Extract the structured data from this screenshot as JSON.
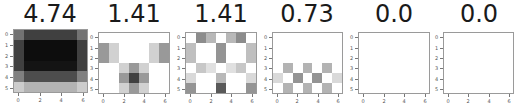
{
  "chart_data": [
    {
      "type": "heatmap",
      "title": "4.74",
      "rows": 6,
      "cols": 7,
      "xticks": [
        "0",
        "2",
        "4",
        "6"
      ],
      "yticks": [
        "0",
        "1",
        "2",
        "3",
        "4",
        "5"
      ],
      "colormap": "gray_r",
      "values": [
        [
          0.55,
          0.75,
          0.75,
          0.75,
          0.75,
          0.75,
          0.55
        ],
        [
          0.75,
          0.95,
          0.95,
          0.95,
          0.95,
          0.95,
          0.75
        ],
        [
          0.75,
          0.95,
          0.95,
          0.95,
          0.95,
          0.95,
          0.75
        ],
        [
          0.75,
          0.92,
          0.92,
          0.92,
          0.92,
          0.92,
          0.75
        ],
        [
          0.5,
          0.7,
          0.7,
          0.7,
          0.7,
          0.7,
          0.5
        ],
        [
          0.2,
          0.3,
          0.3,
          0.3,
          0.3,
          0.3,
          0.2
        ]
      ]
    },
    {
      "type": "heatmap",
      "title": "1.41",
      "rows": 6,
      "cols": 7,
      "xticks": [
        "0",
        "2",
        "4",
        "6"
      ],
      "yticks": [
        "0",
        "1",
        "2",
        "3",
        "4",
        "5"
      ],
      "colormap": "gray_r",
      "values": [
        [
          0,
          0,
          0,
          0,
          0,
          0,
          0
        ],
        [
          0.4,
          0.18,
          0,
          0,
          0,
          0.18,
          0.4
        ],
        [
          0.4,
          0.18,
          0,
          0,
          0,
          0.18,
          0.4
        ],
        [
          0,
          0,
          0.18,
          0.4,
          0.18,
          0,
          0
        ],
        [
          0,
          0,
          0.4,
          0.75,
          0.4,
          0,
          0
        ],
        [
          0,
          0,
          0.18,
          0.4,
          0.18,
          0,
          0
        ]
      ]
    },
    {
      "type": "heatmap",
      "title": "1.41",
      "rows": 6,
      "cols": 7,
      "xticks": [
        "0",
        "2",
        "4",
        "6"
      ],
      "yticks": [
        "0",
        "1",
        "2",
        "3",
        "4",
        "5"
      ],
      "colormap": "gray_r",
      "values": [
        [
          0,
          0.45,
          0.28,
          0,
          0.28,
          0.45,
          0
        ],
        [
          0.25,
          0,
          0,
          0.42,
          0,
          0,
          0.25
        ],
        [
          0.25,
          0,
          0,
          0.42,
          0,
          0,
          0.25
        ],
        [
          0,
          0.22,
          0.12,
          0,
          0.12,
          0.22,
          0
        ],
        [
          0.15,
          0,
          0,
          0.28,
          0,
          0,
          0.15
        ],
        [
          0.42,
          0,
          0,
          0.65,
          0,
          0,
          0.42
        ]
      ]
    },
    {
      "type": "heatmap",
      "title": "0.73",
      "rows": 6,
      "cols": 7,
      "xticks": [
        "0",
        "2",
        "4",
        "6"
      ],
      "yticks": [
        "0",
        "1",
        "2",
        "3",
        "4",
        "5"
      ],
      "colormap": "gray_r",
      "values": [
        [
          0,
          0,
          0,
          0,
          0,
          0,
          0
        ],
        [
          0,
          0,
          0,
          0,
          0,
          0,
          0
        ],
        [
          0,
          0,
          0,
          0,
          0,
          0,
          0
        ],
        [
          0,
          0.3,
          0,
          0.3,
          0,
          0.3,
          0
        ],
        [
          0.15,
          0,
          0.42,
          0,
          0.42,
          0,
          0.15
        ],
        [
          0,
          0.3,
          0,
          0.3,
          0,
          0.3,
          0
        ]
      ]
    },
    {
      "type": "heatmap",
      "title": "0.0",
      "rows": 6,
      "cols": 7,
      "xticks": [
        "0",
        "2",
        "4",
        "6"
      ],
      "yticks": [
        "0",
        "1",
        "2",
        "3",
        "4",
        "5"
      ],
      "colormap": "gray_r",
      "values": [
        [
          0,
          0,
          0,
          0,
          0,
          0,
          0
        ],
        [
          0,
          0,
          0,
          0,
          0,
          0,
          0
        ],
        [
          0,
          0,
          0,
          0,
          0,
          0,
          0
        ],
        [
          0,
          0,
          0,
          0,
          0,
          0,
          0
        ],
        [
          0,
          0,
          0,
          0,
          0,
          0,
          0
        ],
        [
          0,
          0,
          0,
          0,
          0,
          0,
          0
        ]
      ]
    },
    {
      "type": "heatmap",
      "title": "0.0",
      "rows": 6,
      "cols": 7,
      "xticks": [
        "0",
        "2",
        "4",
        "6"
      ],
      "yticks": [
        "0",
        "1",
        "2",
        "3",
        "4",
        "5"
      ],
      "colormap": "gray_r",
      "values": [
        [
          0,
          0,
          0,
          0,
          0,
          0,
          0
        ],
        [
          0,
          0,
          0,
          0,
          0,
          0,
          0
        ],
        [
          0,
          0,
          0,
          0,
          0,
          0,
          0
        ],
        [
          0,
          0,
          0,
          0,
          0,
          0,
          0
        ],
        [
          0,
          0,
          0,
          0,
          0,
          0,
          0
        ],
        [
          0,
          0,
          0,
          0,
          0,
          0,
          0
        ]
      ]
    }
  ],
  "layout": {
    "panels": [
      {
        "left": 13,
        "top": 29,
        "width": 75,
        "height": 64,
        "title_center": 50
      },
      {
        "left": 98,
        "top": 32,
        "width": 72,
        "height": 62,
        "title_center": 134
      },
      {
        "left": 185,
        "top": 32,
        "width": 72,
        "height": 62,
        "title_center": 221
      },
      {
        "left": 272,
        "top": 32,
        "width": 71,
        "height": 62,
        "title_center": 307
      },
      {
        "left": 358,
        "top": 32,
        "width": 72,
        "height": 62,
        "title_center": 394
      },
      {
        "left": 443,
        "top": 32,
        "width": 71,
        "height": 62,
        "title_center": 479
      }
    ]
  }
}
